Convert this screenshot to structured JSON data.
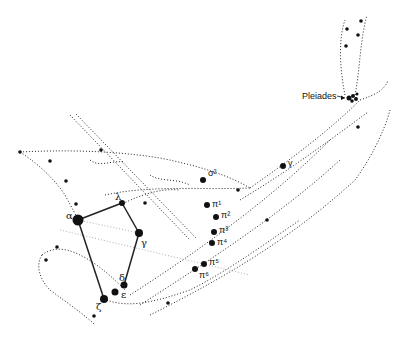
{
  "diagram": {
    "title": "",
    "labels": {
      "alpha": "α",
      "lambda": "λ",
      "gamma_left": "γ",
      "delta": "δ",
      "epsilon": "ε",
      "zeta": "ζ",
      "sigma2": "σ²",
      "gamma_right": "γ",
      "pi1": "π¹",
      "pi2": "π²",
      "pi3": "π³",
      "pi4": "π⁴",
      "pi5": "π⁵",
      "pi6": "π⁶",
      "pleiades": "Pleiades"
    },
    "colors": {
      "ink": "#222222",
      "background": "#ffffff"
    }
  }
}
